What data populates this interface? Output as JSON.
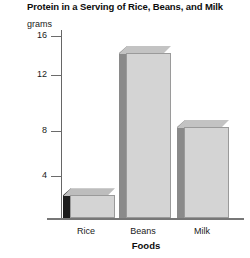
{
  "chart_data": {
    "type": "bar",
    "title": "Protein in a Serving of Rice, Beans, and Milk",
    "categories": [
      "Rice",
      "Beans",
      "Milk"
    ],
    "values": [
      2,
      14.5,
      8
    ],
    "xlabel": "Foods",
    "ylabel": "grams",
    "ylim": [
      0,
      16
    ],
    "yticks": [
      16,
      12,
      8,
      4
    ],
    "ytick_labels": [
      "16",
      "12",
      "8",
      "4"
    ],
    "grid": false,
    "legend": "none",
    "style": "3d-bar",
    "colors": {
      "bar_front": "#d4d4d4",
      "bar_side": "#8a8a8a",
      "bar_side_rice": "#1c1c1c",
      "bar_top": "#c3c3c3",
      "axis": "#6b6b6b",
      "text": "#111111"
    }
  }
}
